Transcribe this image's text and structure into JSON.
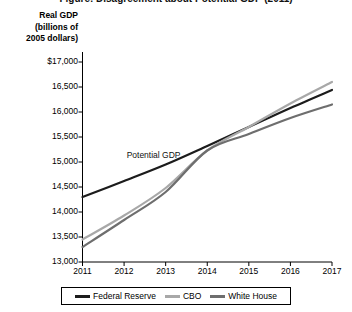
{
  "chart_data": {
    "type": "line",
    "title": "Figure: Disagreement about Potential GDP (2011)",
    "ylabel": "Real GDP (billions of 2005 dollars)",
    "ylabel_lines": [
      "Real GDP",
      "(billions of",
      "2005 dollars)"
    ],
    "xlabel": "",
    "x": [
      2011,
      2012,
      2013,
      2014,
      2015,
      2016,
      2017
    ],
    "xtick_labels": [
      "2011",
      "2012",
      "2013",
      "2014",
      "2015",
      "2016",
      "2017"
    ],
    "ytick_labels": [
      "$17,000",
      "16,500",
      "16,000",
      "15,500",
      "15,000",
      "14,500",
      "14,000",
      "13,500",
      "13,000"
    ],
    "ytick_values": [
      17000,
      16500,
      16000,
      15500,
      15000,
      14500,
      14000,
      13500,
      13000
    ],
    "ylim": [
      13000,
      17000
    ],
    "xlim": [
      2011,
      2017
    ],
    "grid": false,
    "legend_position": "bottom",
    "series": [
      {
        "name": "Federal Reserve",
        "color": "#1c1c1c",
        "values": [
          14300,
          14620,
          14950,
          15320,
          15700,
          16080,
          16440
        ]
      },
      {
        "name": "CBO",
        "color": "#a8a8a8",
        "values": [
          13450,
          13930,
          14480,
          15230,
          15700,
          16170,
          16600
        ]
      },
      {
        "name": "White House",
        "color": "#6e6e6e",
        "values": [
          13300,
          13840,
          14400,
          15230,
          15560,
          15880,
          16150
        ]
      }
    ],
    "annotations": [
      {
        "text": "Potential GDP",
        "x": 2012.35,
        "y": 15120
      }
    ]
  },
  "legend": {
    "entries": [
      {
        "label": "Federal Reserve",
        "color": "#1c1c1c"
      },
      {
        "label": "CBO",
        "color": "#a8a8a8"
      },
      {
        "label": "White House",
        "color": "#6e6e6e"
      }
    ]
  }
}
